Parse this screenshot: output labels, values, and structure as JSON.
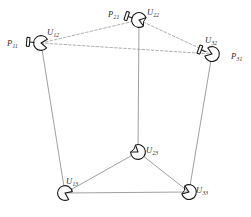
{
  "figure": {
    "background_color": "#ffffff",
    "width": 251,
    "height": 217,
    "solid_edge_color": "#8f8f8f",
    "dashed_edge_color": "#9a9a9a",
    "node_outline_color": "#1a1a1a",
    "node_fill_color": "#ffffff",
    "label_color": "#2b2b2b"
  },
  "nodes": [
    {
      "id": "U12",
      "name": "node-u12",
      "label_main": "U",
      "label_sub": "12",
      "x": 41,
      "y": 43,
      "label_x": 47,
      "label_y": 28,
      "dish_rotation": 5,
      "has_feed": true,
      "feed_side": "left",
      "feed_label_main": "P",
      "feed_label_sub": "11",
      "feed_label_x": 7,
      "feed_label_y": 39
    },
    {
      "id": "U22",
      "name": "node-u22",
      "label_main": "U",
      "label_sub": "22",
      "x": 139,
      "y": 20,
      "label_x": 147,
      "label_y": 8,
      "dish_rotation": 18,
      "has_feed": true,
      "feed_side": "left",
      "feed_label_main": "P",
      "feed_label_sub": "21",
      "feed_label_x": 108,
      "feed_label_y": 10,
      "dish_variant": "bowtie"
    },
    {
      "id": "U32",
      "name": "node-u32",
      "label_main": "U",
      "label_sub": "32",
      "x": 212,
      "y": 54,
      "label_x": 205,
      "label_y": 36,
      "dish_rotation": 200,
      "has_feed": true,
      "feed_side": "right",
      "feed_label_main": "P",
      "feed_label_sub": "31",
      "feed_label_x": 231,
      "feed_label_y": 52
    },
    {
      "id": "U23",
      "name": "node-u23",
      "label_main": "U",
      "label_sub": "23",
      "x": 138,
      "y": 152,
      "label_x": 146,
      "label_y": 146,
      "dish_rotation": 215,
      "has_feed": false,
      "dish_variant": "bowtie"
    },
    {
      "id": "U13",
      "name": "node-u13",
      "label_main": "U",
      "label_sub": "13",
      "x": 65,
      "y": 193,
      "label_x": 66,
      "label_y": 177,
      "dish_rotation": 25,
      "has_feed": false
    },
    {
      "id": "U33",
      "name": "node-u33",
      "label_main": "U",
      "label_sub": "33",
      "x": 189,
      "y": 192,
      "label_x": 196,
      "label_y": 186,
      "dish_rotation": 200,
      "has_feed": false,
      "dish_variant": "bowtie"
    }
  ],
  "edges": [
    {
      "name": "edge-u12-u22",
      "from": "U12",
      "to": "U22",
      "style": "dashed"
    },
    {
      "name": "edge-u12-u32",
      "from": "U12",
      "to": "U32",
      "style": "dashed"
    },
    {
      "name": "edge-u22-u32",
      "from": "U22",
      "to": "U32",
      "style": "dashed"
    },
    {
      "name": "edge-u12-u13",
      "from": "U12",
      "to": "U13",
      "style": "solid"
    },
    {
      "name": "edge-u22-u23",
      "from": "U22",
      "to": "U23",
      "style": "solid"
    },
    {
      "name": "edge-u32-u33",
      "from": "U32",
      "to": "U33",
      "style": "solid"
    },
    {
      "name": "edge-u13-u23",
      "from": "U13",
      "to": "U23",
      "style": "solid"
    },
    {
      "name": "edge-u23-u33",
      "from": "U23",
      "to": "U33",
      "style": "solid"
    },
    {
      "name": "edge-u13-u33",
      "from": "U13",
      "to": "U33",
      "style": "solid"
    }
  ]
}
